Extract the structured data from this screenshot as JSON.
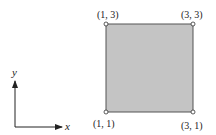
{
  "diagram": {
    "square": {
      "fill": "#c4c4c4",
      "stroke": "#555555",
      "corners": [
        {
          "label": "(1, 3)"
        },
        {
          "label": "(3, 3)"
        },
        {
          "label": "(1, 1)"
        },
        {
          "label": "(3, 1)"
        }
      ]
    },
    "axes": {
      "x_label": "x",
      "y_label": "y"
    }
  }
}
